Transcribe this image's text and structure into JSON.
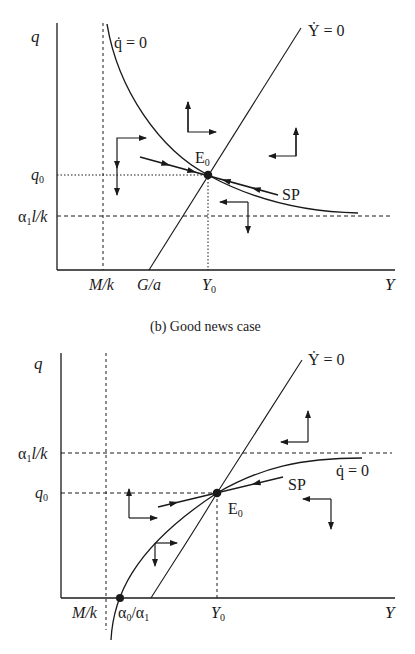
{
  "panels": [
    {
      "id": "a",
      "caption_partial": "(a) ...",
      "y_axis_label": "q",
      "x_axis_label": "Y",
      "curve_labels": {
        "q_dot": "q̇ = 0",
        "Y_dot": "Ẏ = 0",
        "saddle_path": "SP",
        "equilibrium": "E",
        "equilibrium_sub": "0"
      },
      "y_ticks": [
        {
          "label": "q",
          "sub": "0"
        },
        {
          "label": "α",
          "sub": "1",
          "rest": "l/k"
        }
      ],
      "x_ticks": [
        {
          "label": "M/k"
        },
        {
          "label": "G/a"
        },
        {
          "label": "Y",
          "sub": "0"
        }
      ]
    },
    {
      "id": "b",
      "caption": "(b) Good news case",
      "y_axis_label": "q",
      "x_axis_label": "Y",
      "curve_labels": {
        "q_dot": "q̇ = 0",
        "Y_dot": "Ẏ = 0",
        "saddle_path": "SP",
        "equilibrium": "E",
        "equilibrium_sub": "0"
      },
      "y_ticks": [
        {
          "label": "α",
          "sub": "1",
          "rest": "l/k"
        },
        {
          "label": "q",
          "sub": "0"
        }
      ],
      "x_ticks": [
        {
          "label": "M/k"
        },
        {
          "label": "α",
          "sub": "0",
          "rest": "/α",
          "sub2": "1"
        },
        {
          "label": "Y",
          "sub": "0"
        }
      ]
    }
  ],
  "colors": {
    "ink": "#1a1a1a",
    "background": "#ffffff"
  }
}
